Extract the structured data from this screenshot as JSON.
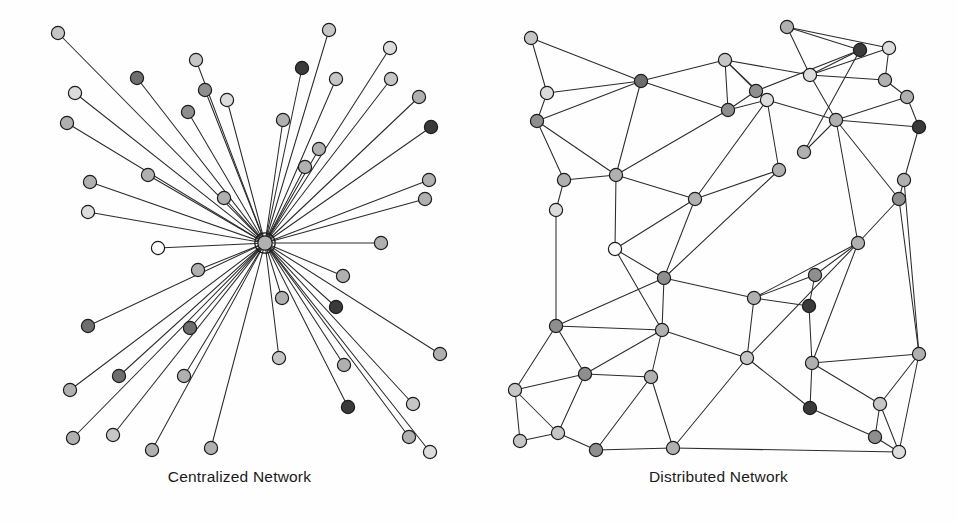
{
  "figure": {
    "background_color": "#fefefe",
    "edge_color": "#2b2b2b",
    "node_stroke_color": "#1c1c1c",
    "caption_color": "#1a1a1a"
  },
  "palette": {
    "white": "#fdfdfd",
    "light": "#dcdcdc",
    "mid_light": "#c6c6c6",
    "mid": "#b0b0b0",
    "mid_dark": "#8e8e8e",
    "dark": "#6e6e6e",
    "very_dark": "#3a3a3a"
  },
  "panels": [
    {
      "id": "centralized",
      "caption": "Centralized Network",
      "layout": "star",
      "viewbox": "0 0 479 470",
      "node_radius": 6.6,
      "hub": {
        "id": "hub",
        "label": "central-hub",
        "x": 265,
        "y": 243,
        "r": 7.2,
        "halo_r": 10.2,
        "shade": "mid"
      },
      "nodes": [
        {
          "id": "c1",
          "x": 58,
          "y": 33,
          "shade": "mid_light"
        },
        {
          "id": "c2",
          "x": 137,
          "y": 78,
          "shade": "dark"
        },
        {
          "id": "c3",
          "x": 75,
          "y": 93,
          "shade": "light"
        },
        {
          "id": "c4",
          "x": 196,
          "y": 60,
          "shade": "mid_light"
        },
        {
          "id": "c5",
          "x": 205,
          "y": 90,
          "shade": "mid_dark"
        },
        {
          "id": "c6",
          "x": 67,
          "y": 123,
          "shade": "mid"
        },
        {
          "id": "c7",
          "x": 188,
          "y": 112,
          "shade": "mid_dark"
        },
        {
          "id": "c8",
          "x": 227,
          "y": 100,
          "shade": "light"
        },
        {
          "id": "c9",
          "x": 329,
          "y": 30,
          "shade": "mid_light"
        },
        {
          "id": "c10",
          "x": 302,
          "y": 68,
          "shade": "very_dark"
        },
        {
          "id": "c11",
          "x": 390,
          "y": 48,
          "shade": "light"
        },
        {
          "id": "c12",
          "x": 336,
          "y": 79,
          "shade": "mid_light"
        },
        {
          "id": "c13",
          "x": 391,
          "y": 79,
          "shade": "mid_light"
        },
        {
          "id": "c14",
          "x": 283,
          "y": 120,
          "shade": "mid"
        },
        {
          "id": "c15",
          "x": 419,
          "y": 97,
          "shade": "mid"
        },
        {
          "id": "c16",
          "x": 431,
          "y": 127,
          "shade": "very_dark"
        },
        {
          "id": "c17",
          "x": 90,
          "y": 182,
          "shade": "mid"
        },
        {
          "id": "c18",
          "x": 148,
          "y": 175,
          "shade": "mid"
        },
        {
          "id": "c19",
          "x": 319,
          "y": 149,
          "shade": "mid"
        },
        {
          "id": "c20",
          "x": 305,
          "y": 167,
          "shade": "mid"
        },
        {
          "id": "c21",
          "x": 88,
          "y": 212,
          "shade": "light"
        },
        {
          "id": "c22",
          "x": 224,
          "y": 198,
          "shade": "mid"
        },
        {
          "id": "c23",
          "x": 429,
          "y": 180,
          "shade": "mid"
        },
        {
          "id": "c24",
          "x": 425,
          "y": 199,
          "shade": "mid"
        },
        {
          "id": "c25",
          "x": 158,
          "y": 248,
          "shade": "white"
        },
        {
          "id": "c26",
          "x": 381,
          "y": 243,
          "shade": "mid"
        },
        {
          "id": "c27",
          "x": 198,
          "y": 270,
          "shade": "mid"
        },
        {
          "id": "c28",
          "x": 343,
          "y": 276,
          "shade": "mid"
        },
        {
          "id": "c29",
          "x": 88,
          "y": 326,
          "shade": "dark"
        },
        {
          "id": "c30",
          "x": 282,
          "y": 298,
          "shade": "mid"
        },
        {
          "id": "c31",
          "x": 336,
          "y": 307,
          "shade": "very_dark"
        },
        {
          "id": "c32",
          "x": 190,
          "y": 328,
          "shade": "dark"
        },
        {
          "id": "c33",
          "x": 440,
          "y": 354,
          "shade": "mid"
        },
        {
          "id": "c34",
          "x": 70,
          "y": 390,
          "shade": "mid"
        },
        {
          "id": "c35",
          "x": 119,
          "y": 376,
          "shade": "dark"
        },
        {
          "id": "c36",
          "x": 184,
          "y": 376,
          "shade": "mid"
        },
        {
          "id": "c37",
          "x": 279,
          "y": 358,
          "shade": "mid_light"
        },
        {
          "id": "c38",
          "x": 344,
          "y": 365,
          "shade": "mid"
        },
        {
          "id": "c39",
          "x": 73,
          "y": 438,
          "shade": "mid"
        },
        {
          "id": "c40",
          "x": 113,
          "y": 435,
          "shade": "mid_light"
        },
        {
          "id": "c41",
          "x": 152,
          "y": 450,
          "shade": "mid"
        },
        {
          "id": "c42",
          "x": 211,
          "y": 448,
          "shade": "mid"
        },
        {
          "id": "c43",
          "x": 348,
          "y": 407,
          "shade": "very_dark"
        },
        {
          "id": "c44",
          "x": 413,
          "y": 404,
          "shade": "mid_light"
        },
        {
          "id": "c45",
          "x": 409,
          "y": 437,
          "shade": "mid"
        },
        {
          "id": "c46",
          "x": 430,
          "y": 452,
          "shade": "light"
        }
      ],
      "node_count": 46,
      "edge_count": 46
    },
    {
      "id": "distributed",
      "caption": "Distributed Network",
      "layout": "mesh",
      "viewbox": "0 0 479 470",
      "node_radius": 6.6,
      "nodes": [
        {
          "id": "d1",
          "x": 52,
          "y": 38,
          "shade": "mid_light"
        },
        {
          "id": "d2",
          "x": 162,
          "y": 81,
          "shade": "dark"
        },
        {
          "id": "d3",
          "x": 68,
          "y": 93,
          "shade": "light"
        },
        {
          "id": "d4",
          "x": 246,
          "y": 60,
          "shade": "mid_light"
        },
        {
          "id": "d5",
          "x": 58,
          "y": 121,
          "shade": "mid_dark"
        },
        {
          "id": "d6",
          "x": 277,
          "y": 91,
          "shade": "mid_dark"
        },
        {
          "id": "d7",
          "x": 249,
          "y": 110,
          "shade": "mid_dark"
        },
        {
          "id": "d8",
          "x": 288,
          "y": 100,
          "shade": "light"
        },
        {
          "id": "d9",
          "x": 308,
          "y": 27,
          "shade": "mid"
        },
        {
          "id": "d10",
          "x": 381,
          "y": 50,
          "shade": "very_dark"
        },
        {
          "id": "d11",
          "x": 410,
          "y": 48,
          "shade": "light"
        },
        {
          "id": "d12",
          "x": 331,
          "y": 75,
          "shade": "light"
        },
        {
          "id": "d13",
          "x": 406,
          "y": 80,
          "shade": "mid"
        },
        {
          "id": "d14",
          "x": 357,
          "y": 120,
          "shade": "mid"
        },
        {
          "id": "d15",
          "x": 428,
          "y": 97,
          "shade": "mid"
        },
        {
          "id": "d16",
          "x": 440,
          "y": 127,
          "shade": "very_dark"
        },
        {
          "id": "d17",
          "x": 85,
          "y": 180,
          "shade": "mid"
        },
        {
          "id": "d18",
          "x": 137,
          "y": 175,
          "shade": "mid"
        },
        {
          "id": "d19",
          "x": 325,
          "y": 152,
          "shade": "mid"
        },
        {
          "id": "d20",
          "x": 300,
          "y": 170,
          "shade": "mid"
        },
        {
          "id": "d21",
          "x": 77,
          "y": 210,
          "shade": "light"
        },
        {
          "id": "d22",
          "x": 216,
          "y": 199,
          "shade": "mid"
        },
        {
          "id": "d23",
          "x": 425,
          "y": 180,
          "shade": "mid"
        },
        {
          "id": "d24",
          "x": 420,
          "y": 199,
          "shade": "mid_dark"
        },
        {
          "id": "d25",
          "x": 136,
          "y": 249,
          "shade": "white"
        },
        {
          "id": "d26",
          "x": 379,
          "y": 243,
          "shade": "mid"
        },
        {
          "id": "d27",
          "x": 185,
          "y": 278,
          "shade": "mid_dark"
        },
        {
          "id": "d28",
          "x": 336,
          "y": 275,
          "shade": "mid_dark"
        },
        {
          "id": "d29",
          "x": 77,
          "y": 326,
          "shade": "mid_dark"
        },
        {
          "id": "d30",
          "x": 275,
          "y": 298,
          "shade": "mid"
        },
        {
          "id": "d31",
          "x": 330,
          "y": 306,
          "shade": "very_dark"
        },
        {
          "id": "d32",
          "x": 183,
          "y": 330,
          "shade": "mid"
        },
        {
          "id": "d33",
          "x": 440,
          "y": 354,
          "shade": "mid"
        },
        {
          "id": "d34",
          "x": 36,
          "y": 390,
          "shade": "mid_light"
        },
        {
          "id": "d35",
          "x": 106,
          "y": 374,
          "shade": "mid_dark"
        },
        {
          "id": "d36",
          "x": 172,
          "y": 377,
          "shade": "mid"
        },
        {
          "id": "d37",
          "x": 268,
          "y": 358,
          "shade": "mid_light"
        },
        {
          "id": "d38",
          "x": 333,
          "y": 363,
          "shade": "mid"
        },
        {
          "id": "d39",
          "x": 41,
          "y": 441,
          "shade": "mid_light"
        },
        {
          "id": "d40",
          "x": 79,
          "y": 433,
          "shade": "mid_light"
        },
        {
          "id": "d41",
          "x": 117,
          "y": 450,
          "shade": "mid_dark"
        },
        {
          "id": "d42",
          "x": 194,
          "y": 448,
          "shade": "mid"
        },
        {
          "id": "d43",
          "x": 331,
          "y": 408,
          "shade": "very_dark"
        },
        {
          "id": "d44",
          "x": 401,
          "y": 404,
          "shade": "mid_light"
        },
        {
          "id": "d45",
          "x": 396,
          "y": 437,
          "shade": "mid_dark"
        },
        {
          "id": "d46",
          "x": 420,
          "y": 452,
          "shade": "light"
        }
      ],
      "edges": [
        [
          "d1",
          "d3"
        ],
        [
          "d1",
          "d2"
        ],
        [
          "d3",
          "d5"
        ],
        [
          "d3",
          "d2"
        ],
        [
          "d5",
          "d2"
        ],
        [
          "d5",
          "d17"
        ],
        [
          "d5",
          "d18"
        ],
        [
          "d2",
          "d4"
        ],
        [
          "d2",
          "d7"
        ],
        [
          "d2",
          "d18"
        ],
        [
          "d4",
          "d7"
        ],
        [
          "d4",
          "d6"
        ],
        [
          "d4",
          "d8"
        ],
        [
          "d4",
          "d12"
        ],
        [
          "d6",
          "d7"
        ],
        [
          "d6",
          "d8"
        ],
        [
          "d7",
          "d8"
        ],
        [
          "d7",
          "d18"
        ],
        [
          "d8",
          "d22"
        ],
        [
          "d8",
          "d20"
        ],
        [
          "d8",
          "d14"
        ],
        [
          "d9",
          "d10"
        ],
        [
          "d9",
          "d11"
        ],
        [
          "d9",
          "d12"
        ],
        [
          "d10",
          "d12"
        ],
        [
          "d10",
          "d19"
        ],
        [
          "d10",
          "d6"
        ],
        [
          "d11",
          "d12"
        ],
        [
          "d11",
          "d13"
        ],
        [
          "d12",
          "d13"
        ],
        [
          "d12",
          "d14"
        ],
        [
          "d13",
          "d15"
        ],
        [
          "d14",
          "d15"
        ],
        [
          "d14",
          "d16"
        ],
        [
          "d14",
          "d19"
        ],
        [
          "d14",
          "d24"
        ],
        [
          "d14",
          "d26"
        ],
        [
          "d15",
          "d16"
        ],
        [
          "d16",
          "d23"
        ],
        [
          "d17",
          "d18"
        ],
        [
          "d17",
          "d21"
        ],
        [
          "d18",
          "d22"
        ],
        [
          "d18",
          "d25"
        ],
        [
          "d19",
          "d14"
        ],
        [
          "d20",
          "d22"
        ],
        [
          "d20",
          "d27"
        ],
        [
          "d21",
          "d29"
        ],
        [
          "d22",
          "d25"
        ],
        [
          "d22",
          "d27"
        ],
        [
          "d23",
          "d24"
        ],
        [
          "d23",
          "d33"
        ],
        [
          "d24",
          "d26"
        ],
        [
          "d24",
          "d33"
        ],
        [
          "d25",
          "d27"
        ],
        [
          "d25",
          "d32"
        ],
        [
          "d26",
          "d28"
        ],
        [
          "d26",
          "d30"
        ],
        [
          "d26",
          "d37"
        ],
        [
          "d26",
          "d38"
        ],
        [
          "d27",
          "d29"
        ],
        [
          "d27",
          "d32"
        ],
        [
          "d27",
          "d30"
        ],
        [
          "d28",
          "d30"
        ],
        [
          "d28",
          "d31"
        ],
        [
          "d29",
          "d34"
        ],
        [
          "d29",
          "d35"
        ],
        [
          "d29",
          "d32"
        ],
        [
          "d30",
          "d31"
        ],
        [
          "d30",
          "d37"
        ],
        [
          "d31",
          "d38"
        ],
        [
          "d32",
          "d36"
        ],
        [
          "d32",
          "d37"
        ],
        [
          "d32",
          "d35"
        ],
        [
          "d33",
          "d38"
        ],
        [
          "d33",
          "d44"
        ],
        [
          "d33",
          "d46"
        ],
        [
          "d34",
          "d35"
        ],
        [
          "d34",
          "d39"
        ],
        [
          "d34",
          "d40"
        ],
        [
          "d35",
          "d36"
        ],
        [
          "d35",
          "d40"
        ],
        [
          "d36",
          "d41"
        ],
        [
          "d36",
          "d42"
        ],
        [
          "d37",
          "d42"
        ],
        [
          "d37",
          "d43"
        ],
        [
          "d38",
          "d43"
        ],
        [
          "d38",
          "d44"
        ],
        [
          "d39",
          "d40"
        ],
        [
          "d40",
          "d41"
        ],
        [
          "d41",
          "d42"
        ],
        [
          "d42",
          "d46"
        ],
        [
          "d43",
          "d45"
        ],
        [
          "d44",
          "d45"
        ],
        [
          "d44",
          "d46"
        ],
        [
          "d45",
          "d46"
        ]
      ],
      "node_count": 46,
      "edge_count": 92
    }
  ],
  "chart_data": {
    "type": "diagram",
    "panels": [
      {
        "name": "Centralized Network",
        "topology": "star",
        "nodes": 46,
        "edges": 46,
        "hub_degree": 45,
        "note": "All peripheral nodes connect only to a single central hub node, which is drawn with a concentric ring."
      },
      {
        "name": "Distributed Network",
        "topology": "mesh",
        "nodes": 46,
        "edges": 92,
        "note": "Nodes are linked to several nearby neighbors forming a triangulated planar mesh with no single hub."
      }
    ]
  }
}
